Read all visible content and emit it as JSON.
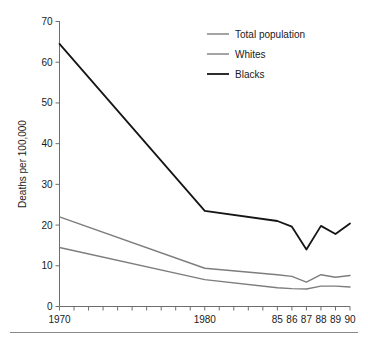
{
  "chart_data": {
    "type": "line",
    "title": "",
    "xlabel": "",
    "ylabel": "Deaths per 100,000",
    "xlim": [
      1970,
      1990
    ],
    "ylim": [
      0,
      70
    ],
    "yticks": [
      0,
      10,
      20,
      30,
      40,
      50,
      60,
      70
    ],
    "ytick_labels": [
      "0",
      "10",
      "20",
      "30",
      "40",
      "50",
      "60",
      "70"
    ],
    "xticks": [
      1970,
      1971,
      1972,
      1973,
      1974,
      1975,
      1976,
      1977,
      1978,
      1979,
      1980,
      1981,
      1982,
      1983,
      1984,
      1985,
      1986,
      1987,
      1988,
      1989,
      1990
    ],
    "xtick_labels": [
      "1970",
      "",
      "",
      "",
      "",
      "",
      "",
      "",
      "",
      "",
      "1980",
      "",
      "",
      "",
      "",
      "85",
      "86",
      "87",
      "88",
      "89",
      "90"
    ],
    "grid": false,
    "legend_position": "top-right",
    "x": [
      1970,
      1980,
      1985,
      1986,
      1987,
      1988,
      1989,
      1990
    ],
    "series": [
      {
        "name": "Total population",
        "color": "#7d7d7d",
        "values": [
          22.0,
          9.4,
          7.8,
          7.4,
          6.0,
          7.8,
          7.2,
          7.6
        ]
      },
      {
        "name": "Whites",
        "color": "#7d7d7d",
        "values": [
          14.5,
          6.6,
          4.6,
          4.4,
          4.3,
          5.0,
          5.0,
          4.8
        ]
      },
      {
        "name": "Blacks",
        "color": "#151515",
        "values": [
          64.5,
          23.5,
          21.0,
          19.6,
          14.0,
          19.8,
          17.8,
          20.4
        ]
      }
    ]
  },
  "legend": {
    "entries": [
      {
        "label": "Total population",
        "color": "#7d7d7d"
      },
      {
        "label": "Whites",
        "color": "#7d7d7d"
      },
      {
        "label": "Blacks",
        "color": "#151515"
      }
    ]
  },
  "axes": {
    "y_title": "Deaths per 100,000",
    "y_labels": [
      "70",
      "60",
      "50",
      "40",
      "30",
      "20",
      "10",
      "0"
    ],
    "x_labels": [
      "1970",
      "1980",
      "85",
      "86",
      "87",
      "88",
      "89",
      "90"
    ]
  },
  "colors": {
    "axis": "#6e6e6e",
    "text": "#1a1a1a",
    "gray_series": "#7d7d7d",
    "black_series": "#151515",
    "rule": "#8a8a8a"
  }
}
